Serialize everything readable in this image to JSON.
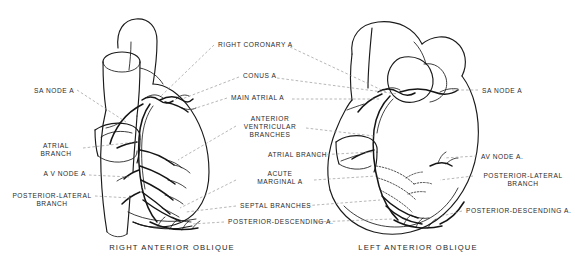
{
  "figure": {
    "background_color": "#ffffff",
    "ink_color": "#1a1a1a",
    "leader_color": "#8a8a8a",
    "signature": "D. Pierce"
  },
  "captions": [
    {
      "id": "right-anterior-oblique",
      "text": "RIGHT ANTERIOR OBLIQUE",
      "x": 172,
      "y": 248
    },
    {
      "id": "left-anterior-oblique",
      "text": "LEFT ANTERIOR OBLIQUE",
      "x": 418,
      "y": 248
    }
  ],
  "labels": {
    "left_column": [
      {
        "id": "sa-node-a-left",
        "text": "SA NODE A",
        "x": 34,
        "y": 91,
        "align": "l"
      },
      {
        "id": "atrial-branch-left",
        "text": "ATRIAL\nBRANCH",
        "x": 56,
        "y": 146,
        "align": "c"
      },
      {
        "id": "av-node-a-left",
        "text": "A V NODE A",
        "x": 86,
        "y": 174,
        "align": "r"
      },
      {
        "id": "posterior-lateral-branch-left",
        "text": "POSTERIOR-LATERAL\nBRANCH",
        "x": 52,
        "y": 196,
        "align": "c"
      }
    ],
    "center_column": [
      {
        "id": "right-coronary-a",
        "text": "RIGHT CORONARY A",
        "x": 218,
        "y": 45,
        "align": "l"
      },
      {
        "id": "conus-a",
        "text": "CONUS A",
        "x": 243,
        "y": 76,
        "align": "l"
      },
      {
        "id": "main-atrial-a",
        "text": "MAIN ATRIAL A",
        "x": 231,
        "y": 98,
        "align": "l"
      },
      {
        "id": "anterior-ventricular-branches",
        "text": "ANTERIOR\nVENTRICULAR\nBRANCHES",
        "x": 270,
        "y": 123,
        "align": "c"
      },
      {
        "id": "atrial-branch-center",
        "text": "ATRIAL BRANCH",
        "x": 268,
        "y": 155,
        "align": "l"
      },
      {
        "id": "acute-marginal-a",
        "text": "ACUTE\nMARGINAL A",
        "x": 280,
        "y": 178,
        "align": "c"
      },
      {
        "id": "septal-branches",
        "text": "SEPTAL BRANCHES",
        "x": 240,
        "y": 206,
        "align": "l"
      },
      {
        "id": "posterior-descending-a-center",
        "text": "POSTERIOR-DESCENDING A.",
        "x": 228,
        "y": 222,
        "align": "l"
      }
    ],
    "right_column": [
      {
        "id": "sa-node-a-right",
        "text": "SA NODE A",
        "x": 482,
        "y": 91,
        "align": "l"
      },
      {
        "id": "av-node-a-right",
        "text": "AV NODE A.",
        "x": 481,
        "y": 157,
        "align": "l"
      },
      {
        "id": "posterior-lateral-branch-right",
        "text": "POSTERIOR-LATERAL\nBRANCH",
        "x": 523,
        "y": 176,
        "align": "c"
      },
      {
        "id": "posterior-descending-a-right",
        "text": "POSTERIOR-DESCENDING A.",
        "x": 466,
        "y": 211,
        "align": "l"
      }
    ]
  }
}
